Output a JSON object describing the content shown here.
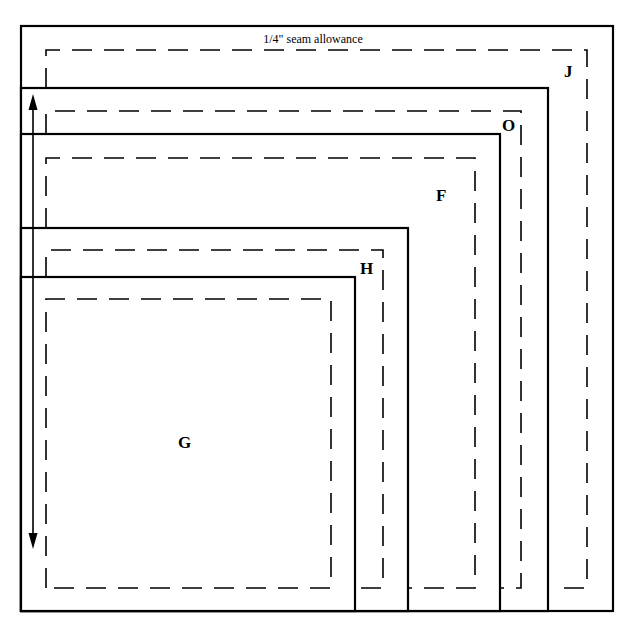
{
  "diagram": {
    "title_note": "1/4\" seam allowance",
    "pieces": [
      {
        "label": "J",
        "outer": {
          "x": 21,
          "y": 26,
          "w": 592,
          "h": 585
        },
        "dash": {
          "x": 46,
          "y": 50,
          "r": 587,
          "b": 588
        },
        "label_pos": {
          "x": 564,
          "y": 77
        }
      },
      {
        "label": "O",
        "outer": {
          "x": 21,
          "y": 88,
          "w": 527,
          "h": 523
        },
        "dash": {
          "x": 46,
          "y": 111,
          "r": 521,
          "b": 588
        },
        "label_pos": {
          "x": 502,
          "y": 131
        }
      },
      {
        "label": "F",
        "outer": {
          "x": 21,
          "y": 134,
          "w": 479,
          "h": 477
        },
        "dash": {
          "x": 46,
          "y": 158,
          "r": 475,
          "b": 588
        },
        "label_pos": {
          "x": 436,
          "y": 201
        }
      },
      {
        "label": "H",
        "outer": {
          "x": 21,
          "y": 228,
          "w": 387,
          "h": 383
        },
        "dash": {
          "x": 46,
          "y": 250,
          "r": 383,
          "b": 588
        },
        "label_pos": {
          "x": 360,
          "y": 274
        }
      },
      {
        "label": "G",
        "outer": {
          "x": 21,
          "y": 277,
          "w": 334,
          "h": 334
        },
        "dash": {
          "x": 46,
          "y": 299,
          "r": 331,
          "b": 588
        },
        "label_pos": {
          "x": 178,
          "y": 448
        }
      }
    ],
    "grain_arrow": {
      "x": 33,
      "y1": 95,
      "y2": 548
    },
    "colors": {
      "line": "#000000",
      "background": "#ffffff"
    }
  }
}
